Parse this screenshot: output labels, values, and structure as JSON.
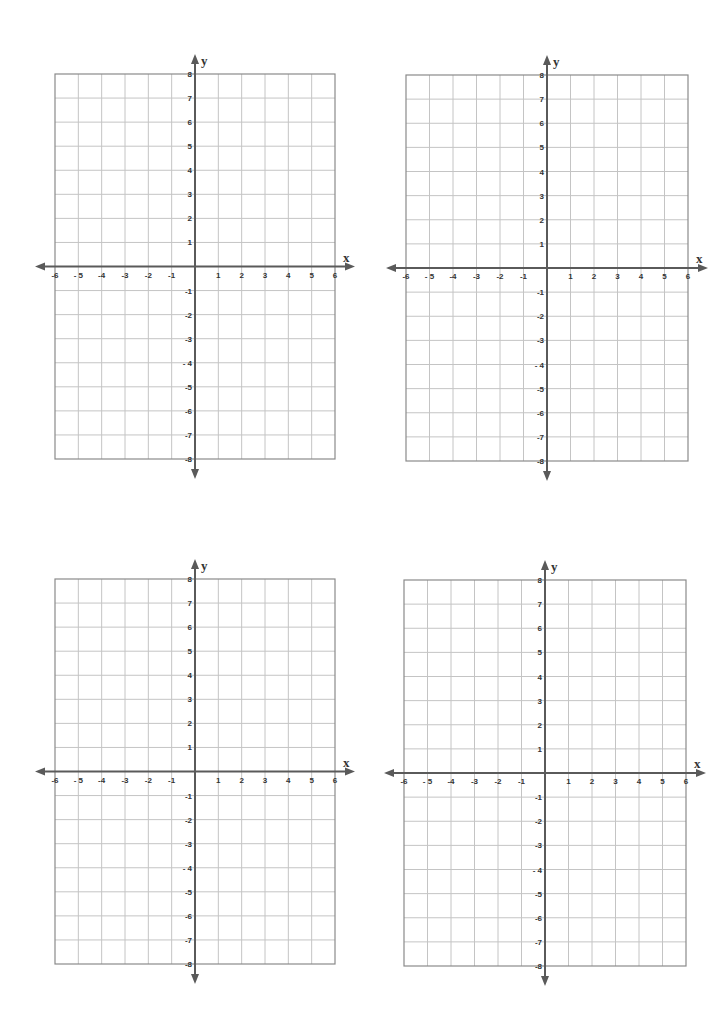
{
  "page": {
    "background": "#ffffff"
  },
  "style": {
    "grid_line_color": "#c4c4c4",
    "border_color": "#8a8a8a",
    "axis_color": "#5a5a5a",
    "label_color": "#333333"
  },
  "graphs": [
    {
      "id": "top-left",
      "left": 55,
      "top": 74,
      "width": 280,
      "height": 385
    },
    {
      "id": "top-right",
      "left": 406,
      "top": 75,
      "width": 282,
      "height": 386
    },
    {
      "id": "bottom-left",
      "left": 55,
      "top": 579,
      "width": 280,
      "height": 385
    },
    {
      "id": "bottom-right",
      "left": 404,
      "top": 580,
      "width": 282,
      "height": 386
    }
  ],
  "chart_data": [
    {
      "type": "scatter",
      "title": "",
      "xlabel": "x",
      "ylabel": "y",
      "xlim": [
        -6,
        6
      ],
      "ylim": [
        -8,
        8
      ],
      "grid": true,
      "x_tick_labels": [
        "-6",
        "- 5",
        "-4",
        "-3",
        "-2",
        "-1",
        "1",
        "2",
        "3",
        "4",
        "5",
        "6"
      ],
      "y_tick_labels": [
        "8",
        "7",
        "6",
        "5",
        "4",
        "3",
        "2",
        "1",
        "-1",
        "-2",
        "-3",
        "- 4",
        "-5",
        "-6",
        "-7",
        "-8"
      ],
      "series": []
    },
    {
      "type": "scatter",
      "title": "",
      "xlabel": "x",
      "ylabel": "y",
      "xlim": [
        -6,
        6
      ],
      "ylim": [
        -8,
        8
      ],
      "grid": true,
      "x_tick_labels": [
        "-6",
        "- 5",
        "-4",
        "-3",
        "-2",
        "-1",
        "1",
        "2",
        "3",
        "4",
        "5",
        "6"
      ],
      "y_tick_labels": [
        "8",
        "7",
        "6",
        "5",
        "4",
        "3",
        "2",
        "1",
        "-1",
        "-2",
        "-3",
        "- 4",
        "-5",
        "-6",
        "-7",
        "-8"
      ],
      "series": []
    },
    {
      "type": "scatter",
      "title": "",
      "xlabel": "x",
      "ylabel": "y",
      "xlim": [
        -6,
        6
      ],
      "ylim": [
        -8,
        8
      ],
      "grid": true,
      "x_tick_labels": [
        "-6",
        "- 5",
        "-4",
        "-3",
        "-2",
        "-1",
        "1",
        "2",
        "3",
        "4",
        "5",
        "6"
      ],
      "y_tick_labels": [
        "8",
        "7",
        "6",
        "5",
        "4",
        "3",
        "2",
        "1",
        "-1",
        "-2",
        "-3",
        "- 4",
        "-5",
        "-6",
        "-7",
        "-8"
      ],
      "series": []
    },
    {
      "type": "scatter",
      "title": "",
      "xlabel": "x",
      "ylabel": "y",
      "xlim": [
        -6,
        6
      ],
      "ylim": [
        -8,
        8
      ],
      "grid": true,
      "x_tick_labels": [
        "-6",
        "- 5",
        "-4",
        "-3",
        "-2",
        "-1",
        "1",
        "2",
        "3",
        "4",
        "5",
        "6"
      ],
      "y_tick_labels": [
        "8",
        "7",
        "6",
        "5",
        "4",
        "3",
        "2",
        "1",
        "-1",
        "-2",
        "-3",
        "- 4",
        "-5",
        "-6",
        "-7",
        "-8"
      ],
      "series": []
    }
  ]
}
